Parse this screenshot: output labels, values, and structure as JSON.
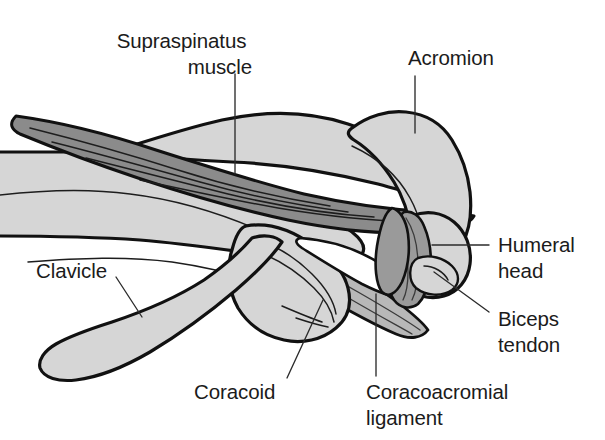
{
  "figure": {
    "background_color": "#ffffff",
    "colors": {
      "bone_fill": "#d6d6d6",
      "muscle_fill": "#8b8b8b",
      "ligament_fill": "#b8b8b8",
      "tendon_fill": "#9a9a9a",
      "outline": "#111111",
      "text": "#1b1b1b",
      "leader_line": "#2b2b2b"
    }
  },
  "labels": {
    "supraspinatus": {
      "line1": "Supraspinatus",
      "line2": "muscle",
      "align": "right"
    },
    "acromion": {
      "line1": "Acromion",
      "align": "left"
    },
    "humeral_head": {
      "line1": "Humeral",
      "line2": "head",
      "align": "left"
    },
    "biceps_tendon": {
      "line1": "Biceps",
      "line2": "tendon",
      "align": "left"
    },
    "clavicle": {
      "line1": "Clavicle",
      "align": "left"
    },
    "coracoid": {
      "line1": "Coracoid",
      "align": "left"
    },
    "coracoacromial_ligament": {
      "line1": "Coracoacromial",
      "line2": "ligament",
      "align": "left"
    }
  },
  "structures": [
    {
      "id": "scapula-body",
      "name": "Scapula body / supraspinous fossa",
      "tissue": "bone"
    },
    {
      "id": "supraspinatus-muscle",
      "name": "Supraspinatus muscle",
      "tissue": "muscle"
    },
    {
      "id": "acromion",
      "name": "Acromion",
      "tissue": "bone"
    },
    {
      "id": "clavicle",
      "name": "Clavicle",
      "tissue": "bone"
    },
    {
      "id": "coracoid",
      "name": "Coracoid process",
      "tissue": "bone"
    },
    {
      "id": "coracoacromial-ligament",
      "name": "Coracoacromial ligament",
      "tissue": "ligament"
    },
    {
      "id": "humeral-head",
      "name": "Humeral head",
      "tissue": "bone"
    },
    {
      "id": "biceps-tendon",
      "name": "Biceps tendon",
      "tissue": "tendon"
    }
  ]
}
